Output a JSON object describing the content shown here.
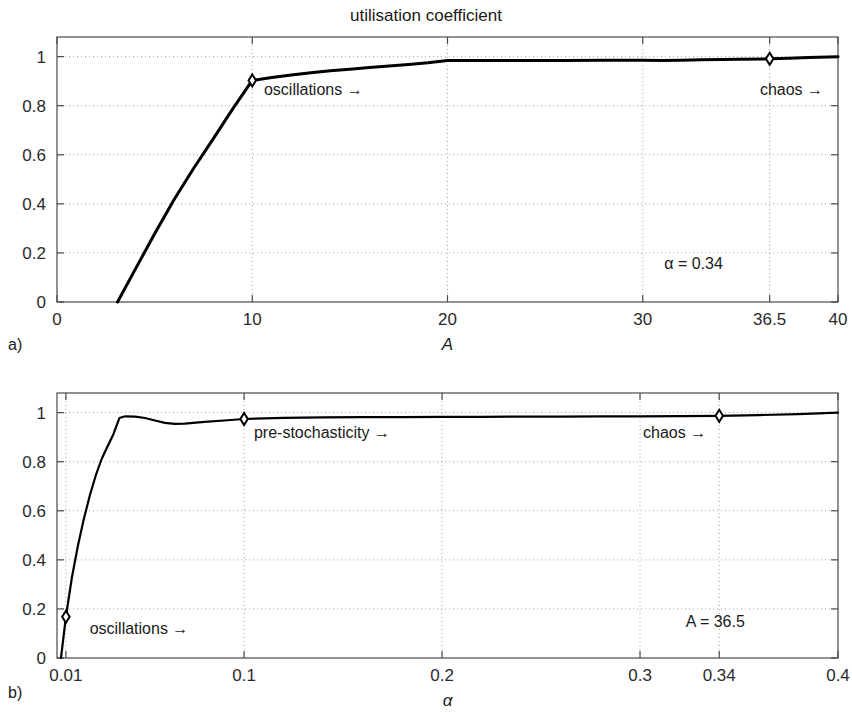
{
  "figure": {
    "title": "utilisation coefficient",
    "panel_a_letter": "a)",
    "panel_b_letter": "b)"
  },
  "chart_data": [
    {
      "id": "panel-a",
      "type": "line",
      "title": "utilisation coefficient",
      "xlabel": "A",
      "ylabel": "",
      "xlim": [
        0,
        40
      ],
      "ylim": [
        0,
        1.08
      ],
      "grid": true,
      "legend": "none",
      "xticks": [
        0,
        10,
        20,
        30,
        36.5,
        40
      ],
      "xticklabels": [
        "0",
        "10",
        "20",
        "30",
        "36.5",
        "40"
      ],
      "yticks": [
        0,
        0.2,
        0.4,
        0.6,
        0.8,
        1
      ],
      "yticklabels": [
        "0",
        "0.2",
        "0.4",
        "0.6",
        "0.8",
        "1"
      ],
      "series": [
        {
          "name": "utilisation coefficient vs A",
          "x": [
            3.1,
            4,
            5,
            6,
            7,
            8,
            9,
            10,
            11,
            12,
            13,
            14,
            15,
            16,
            17,
            18,
            19,
            20,
            21,
            22,
            24,
            26,
            28,
            30,
            31,
            32,
            33,
            34,
            35,
            36.5,
            37.5,
            38.5,
            40
          ],
          "y": [
            0.0,
            0.132,
            0.278,
            0.418,
            0.545,
            0.665,
            0.787,
            0.903,
            0.915,
            0.925,
            0.934,
            0.942,
            0.949,
            0.956,
            0.962,
            0.968,
            0.975,
            0.984,
            0.984,
            0.984,
            0.984,
            0.984,
            0.985,
            0.985,
            0.984,
            0.985,
            0.987,
            0.988,
            0.989,
            0.991,
            0.993,
            0.996,
            1.0
          ]
        }
      ],
      "markers": [
        {
          "name": "oscillations-marker",
          "x": 10,
          "y": 0.903
        },
        {
          "name": "chaos-marker",
          "x": 36.5,
          "y": 0.991
        }
      ],
      "annotations": [
        {
          "name": "oscillations-annotation",
          "text": "oscillations →",
          "x": 10.6,
          "y": 0.845,
          "anchor": "start"
        },
        {
          "name": "chaos-annotation",
          "text": "chaos →",
          "x": 36.0,
          "y": 0.845,
          "anchor": "start"
        },
        {
          "name": "alpha-parameter",
          "text": "α = 0.34",
          "x": 32.6,
          "y": 0.133,
          "anchor": "middle"
        }
      ]
    },
    {
      "id": "panel-b",
      "type": "line",
      "title": "",
      "xlabel": "α",
      "ylabel": "",
      "xlim": [
        0.0055,
        0.4
      ],
      "ylim": [
        0,
        1.08
      ],
      "grid": true,
      "legend": "none",
      "xticks": [
        0.01,
        0.1,
        0.2,
        0.3,
        0.34,
        0.4
      ],
      "xticklabels": [
        "0.01",
        "0.1",
        "0.2",
        "0.3",
        "0.34",
        "0.4"
      ],
      "yticks": [
        0,
        0.2,
        0.4,
        0.6,
        0.8,
        1
      ],
      "yticklabels": [
        "0",
        "0.2",
        "0.4",
        "0.6",
        "0.8",
        "1"
      ],
      "series": [
        {
          "name": "utilisation coefficient vs alpha",
          "x": [
            0.0075,
            0.01,
            0.013,
            0.016,
            0.019,
            0.022,
            0.025,
            0.028,
            0.031,
            0.034,
            0.037,
            0.04,
            0.045,
            0.05,
            0.055,
            0.06,
            0.065,
            0.07,
            0.08,
            0.09,
            0.1,
            0.12,
            0.14,
            0.16,
            0.18,
            0.2,
            0.22,
            0.24,
            0.26,
            0.28,
            0.3,
            0.32,
            0.34,
            0.36,
            0.38,
            0.4
          ],
          "y": [
            0.0,
            0.168,
            0.327,
            0.455,
            0.565,
            0.66,
            0.742,
            0.81,
            0.862,
            0.912,
            0.978,
            0.985,
            0.984,
            0.978,
            0.968,
            0.958,
            0.954,
            0.955,
            0.962,
            0.968,
            0.974,
            0.979,
            0.981,
            0.982,
            0.982,
            0.983,
            0.983,
            0.984,
            0.984,
            0.985,
            0.985,
            0.986,
            0.987,
            0.99,
            0.994,
            1.0
          ]
        }
      ],
      "markers": [
        {
          "name": "oscillations-marker",
          "x": 0.01,
          "y": 0.168
        },
        {
          "name": "pre-stochasticity-marker",
          "x": 0.1,
          "y": 0.974
        },
        {
          "name": "chaos-marker",
          "x": 0.34,
          "y": 0.987
        }
      ],
      "annotations": [
        {
          "name": "oscillations-annotation",
          "text": "oscillations →",
          "x": 0.022,
          "y": 0.098,
          "anchor": "start"
        },
        {
          "name": "pre-stochasticity-annotation",
          "text": "pre-stochasticity →",
          "x": 0.105,
          "y": 0.895,
          "anchor": "start"
        },
        {
          "name": "chaos-annotation",
          "text": "chaos →",
          "x": 0.3015,
          "y": 0.895,
          "anchor": "start"
        },
        {
          "name": "a-parameter",
          "text": "A = 36.5",
          "x": 0.338,
          "y": 0.128,
          "anchor": "middle"
        }
      ]
    }
  ]
}
